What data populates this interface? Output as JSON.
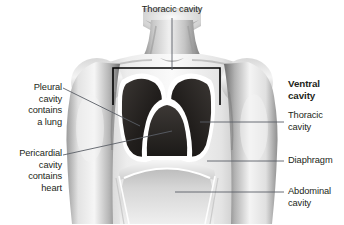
{
  "figure": {
    "style": "grayscale airbrush medical illustration",
    "background_color": "#ffffff",
    "ink_color": "#231f20",
    "leader_color": "#5a5f66",
    "bracket_color": "#000000"
  },
  "labels": {
    "top": {
      "text": "Thoracic cavity",
      "bold": false,
      "align": "center",
      "x": 172,
      "y": 6
    },
    "left_upper": {
      "text": "Pleural\ncavity\ncontains\na lung",
      "bold": false,
      "align": "right",
      "x": 18,
      "y": 84
    },
    "left_lower": {
      "text": "Pericardial\ncavity\ncontains\nheart",
      "bold": false,
      "align": "right",
      "x": 9,
      "y": 150
    },
    "right_heading": {
      "text": "Ventral\ncavity",
      "bold": true,
      "align": "left",
      "x": 288,
      "y": 84
    },
    "right_thoracic": {
      "text": "Thoracic\ncavity",
      "bold": false,
      "align": "left",
      "x": 288,
      "y": 115
    },
    "right_diaphragm": {
      "text": "Diaphragm",
      "bold": false,
      "align": "left",
      "x": 288,
      "y": 155
    },
    "right_abdominal": {
      "text": "Abdominal\ncavity",
      "bold": false,
      "align": "left",
      "x": 288,
      "y": 186
    }
  },
  "leaders": [
    {
      "name": "thoracic-cavity-top-leader",
      "x1": 172,
      "y1": 18,
      "x2": 172,
      "y2": 70
    },
    {
      "name": "pleural-cavity-leader",
      "x1": 63,
      "y1": 88,
      "x2": 140,
      "y2": 126
    },
    {
      "name": "pericardial-cavity-leader",
      "x1": 63,
      "y1": 155,
      "x2": 172,
      "y2": 131
    },
    {
      "name": "thoracic-cavity-right-leader",
      "x1": 284,
      "y1": 122,
      "x2": 200,
      "y2": 122
    },
    {
      "name": "diaphragm-leader",
      "x1": 284,
      "y1": 161,
      "x2": 207,
      "y2": 161
    },
    {
      "name": "abdominal-cavity-leader",
      "x1": 284,
      "y1": 192,
      "x2": 175,
      "y2": 192
    }
  ],
  "bracket": {
    "name": "thoracic-cavity-bracket",
    "left_x": 113,
    "right_x": 220,
    "top_y": 68,
    "leg_bottom_y": 105
  },
  "anatomy": {
    "pleural_cavity_fill": "#231f20",
    "pleural_outline": "#ffffff",
    "pericardial_cavity_fill": "#2b2725",
    "abdominal_cavity_fill": "#d0d0d0",
    "skin_light": "#f2f2f2",
    "skin_mid": "#b9b9b9",
    "skin_dark": "#6e6e6e"
  }
}
